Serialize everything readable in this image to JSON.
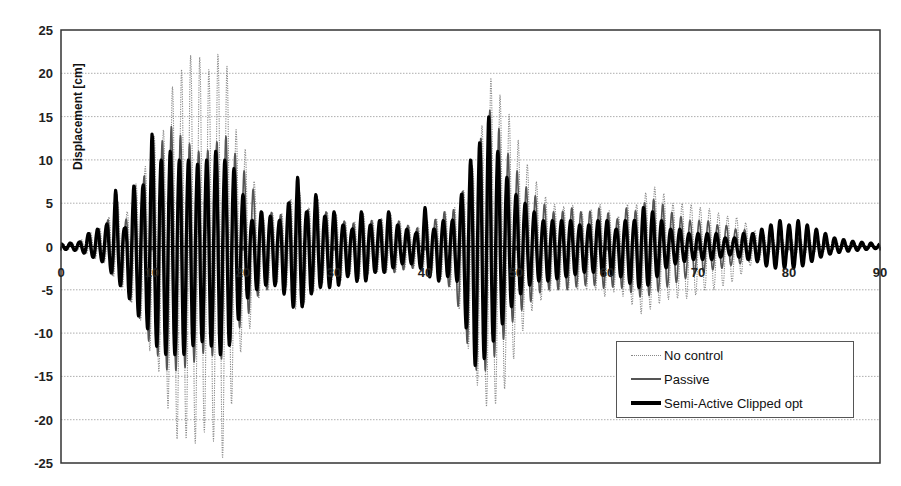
{
  "chart_data": {
    "type": "line",
    "title": "",
    "xlabel": "",
    "ylabel": "Displacement [cm]",
    "xlim": [
      0,
      90
    ],
    "ylim": [
      -25,
      25
    ],
    "x_ticks": [
      0,
      10,
      20,
      30,
      40,
      50,
      60,
      70,
      80,
      90
    ],
    "x_tick_labels": [
      "0",
      "10",
      "20",
      "30",
      "40",
      "50",
      "60",
      "70",
      "80",
      "90"
    ],
    "y_ticks": [
      25,
      20,
      15,
      10,
      5,
      0,
      -5,
      -10,
      -15,
      -20,
      -25
    ],
    "y_tick_labels": [
      "25",
      "20",
      "15",
      "10",
      "5",
      "0",
      "-5",
      "-10",
      "-15",
      "-20",
      "-25"
    ],
    "grid": {
      "horizontal": true,
      "vertical": false,
      "style": "dotted"
    },
    "legend_position": "lower right (inside plot)",
    "series": [
      {
        "name": "No control",
        "style": "dotted-thin",
        "color": "#8a8a8a",
        "peaks_t": [
          0,
          2,
          3,
          4,
          5,
          6,
          7,
          8,
          9,
          10,
          11,
          12,
          13,
          14,
          15,
          16,
          17,
          18,
          19,
          20,
          21,
          22,
          23,
          24,
          25,
          26,
          27,
          28,
          29,
          30,
          31,
          32,
          33,
          34,
          35,
          36,
          37,
          38,
          39,
          40,
          41,
          42,
          43,
          44,
          45,
          46,
          47,
          48,
          49,
          50,
          51,
          52,
          53,
          54,
          55,
          56,
          57,
          58,
          59,
          60,
          61,
          62,
          63,
          64,
          65,
          66,
          67,
          68,
          69,
          70,
          71,
          72,
          73,
          74,
          75,
          76,
          77,
          78,
          79,
          80,
          81,
          82,
          83,
          84,
          85,
          86,
          87,
          88,
          89,
          90
        ],
        "peaks_max": [
          0.3,
          0.5,
          1.5,
          2,
          2.5,
          6,
          3,
          7,
          8,
          13,
          12,
          18,
          20,
          22,
          22.5,
          20,
          22,
          23,
          14,
          12,
          9,
          3,
          4,
          3.5,
          5,
          7,
          4,
          6,
          4,
          4,
          3,
          2.5,
          4,
          3,
          3,
          4,
          3,
          2.5,
          2,
          3,
          3,
          4,
          4,
          6,
          8,
          12,
          20,
          18,
          16,
          13,
          10,
          8,
          6,
          5,
          4.5,
          5,
          4,
          4,
          5,
          4.5,
          3,
          5,
          4.5,
          6,
          7,
          6.5,
          5,
          5,
          5,
          4.5,
          4.5,
          4,
          3.5,
          3.5,
          3,
          2,
          1.5,
          1,
          1,
          1,
          1,
          1,
          0.8,
          0.6,
          0.5,
          0.4,
          0.3,
          0.3,
          0.2,
          0.2
        ],
        "peaks_min": [
          -0.3,
          -0.5,
          -1,
          -1.5,
          -2,
          -4,
          -5,
          -7,
          -9,
          -13,
          -15,
          -20,
          -23,
          -22,
          -23,
          -21,
          -23,
          -25,
          -16,
          -11,
          -9,
          -5,
          -5,
          -4,
          -5,
          -8,
          -6,
          -5,
          -4,
          -4,
          -4,
          -3,
          -4,
          -3,
          -3,
          -3,
          -3,
          -2.5,
          -2.5,
          -3,
          -3,
          -4,
          -5,
          -8,
          -13,
          -17,
          -19,
          -18,
          -16,
          -12,
          -9,
          -7,
          -6,
          -5,
          -5,
          -5,
          -5,
          -5,
          -5,
          -6,
          -5,
          -6,
          -7,
          -8,
          -7,
          -6.5,
          -6,
          -6,
          -6,
          -5.5,
          -5,
          -5,
          -4.5,
          -4,
          -3,
          -2,
          -1.5,
          -1,
          -1,
          -1,
          -1,
          -1,
          -0.8,
          -0.6,
          -0.5,
          -0.4,
          -0.3,
          -0.3,
          -0.2,
          -0.2
        ]
      },
      {
        "name": "Passive",
        "style": "solid-medium",
        "color": "#555555",
        "peaks_t": [
          0,
          2,
          3,
          4,
          5,
          6,
          7,
          8,
          9,
          10,
          11,
          12,
          13,
          14,
          15,
          16,
          17,
          18,
          19,
          20,
          21,
          22,
          23,
          24,
          25,
          26,
          27,
          28,
          29,
          30,
          31,
          32,
          33,
          34,
          35,
          36,
          37,
          38,
          39,
          40,
          41,
          42,
          43,
          44,
          45,
          46,
          47,
          48,
          49,
          50,
          51,
          52,
          53,
          54,
          55,
          56,
          57,
          58,
          59,
          60,
          61,
          62,
          63,
          64,
          65,
          66,
          67,
          68,
          69,
          70,
          71,
          72,
          73,
          74,
          75,
          76,
          77,
          78,
          79,
          80,
          81,
          82,
          83,
          84,
          85,
          86,
          87,
          88,
          89,
          90
        ],
        "peaks_max": [
          0.3,
          0.5,
          1.5,
          2,
          2.5,
          6.5,
          2.5,
          7,
          7.5,
          12.5,
          12,
          14,
          13,
          12,
          11,
          11,
          12,
          13,
          11,
          9,
          7,
          4,
          4,
          3.5,
          5,
          7,
          4,
          6,
          4,
          4,
          3,
          2.5,
          4,
          3,
          3,
          4,
          3,
          2.5,
          2,
          3,
          3,
          4,
          4,
          6,
          9,
          12,
          16,
          14,
          11,
          9,
          7,
          6,
          5,
          4,
          4,
          4.5,
          4,
          4,
          4.5,
          4,
          3,
          4.5,
          4,
          5,
          5.5,
          5,
          4,
          3.5,
          3,
          3,
          3,
          2.5,
          2.5,
          2,
          2,
          1.5,
          1.5,
          1,
          1,
          1,
          1,
          1,
          0.8,
          0.6,
          0.5,
          0.4,
          0.3,
          0.3,
          0.2,
          0.2
        ],
        "peaks_min": [
          -0.3,
          -0.5,
          -1,
          -1.5,
          -2,
          -4,
          -5,
          -7,
          -9,
          -12,
          -13,
          -15,
          -14,
          -14,
          -13,
          -12,
          -13,
          -13,
          -10,
          -9,
          -7,
          -5,
          -5,
          -4,
          -5,
          -8,
          -6,
          -5,
          -4,
          -4,
          -4,
          -3,
          -4,
          -3,
          -3,
          -3,
          -3,
          -2.5,
          -2.5,
          -3,
          -3,
          -4,
          -5,
          -8,
          -13,
          -15,
          -14,
          -12,
          -10,
          -8,
          -7,
          -6,
          -5,
          -5,
          -5,
          -5,
          -4.5,
          -4.5,
          -4.5,
          -5,
          -4.5,
          -5,
          -5.5,
          -6,
          -5.5,
          -5,
          -4.5,
          -4,
          -3.5,
          -3,
          -3,
          -2.5,
          -2.5,
          -2,
          -2,
          -1.5,
          -1.5,
          -1,
          -1,
          -1,
          -1,
          -1,
          -0.8,
          -0.6,
          -0.5,
          -0.4,
          -0.3,
          -0.3,
          -0.2,
          -0.2
        ]
      },
      {
        "name": "Semi-Active Clipped opt",
        "style": "solid-thick",
        "color": "#000000",
        "peaks_t": [
          0,
          2,
          3,
          4,
          5,
          6,
          7,
          8,
          9,
          10,
          11,
          12,
          13,
          14,
          15,
          16,
          17,
          18,
          19,
          20,
          21,
          22,
          23,
          24,
          25,
          26,
          27,
          28,
          29,
          30,
          31,
          32,
          33,
          34,
          35,
          36,
          37,
          38,
          39,
          40,
          41,
          42,
          43,
          44,
          45,
          46,
          47,
          48,
          49,
          50,
          51,
          52,
          53,
          54,
          55,
          56,
          57,
          58,
          59,
          60,
          61,
          62,
          63,
          64,
          65,
          66,
          67,
          68,
          69,
          70,
          71,
          72,
          73,
          74,
          75,
          76,
          77,
          78,
          79,
          80,
          81,
          82,
          83,
          84,
          85,
          86,
          87,
          88,
          89,
          90
        ],
        "peaks_max": [
          0.3,
          0.5,
          1.5,
          2,
          2.5,
          6.5,
          2,
          7,
          7,
          13,
          10,
          11,
          10,
          10,
          9.5,
          10,
          11,
          10,
          9,
          6,
          3,
          4,
          3.5,
          3,
          5,
          8,
          4,
          6,
          3.5,
          4,
          2.5,
          2,
          4,
          2.5,
          3,
          4,
          2.5,
          2,
          1.5,
          4.5,
          2,
          3,
          3,
          6,
          10,
          12,
          15,
          11,
          8,
          6,
          5,
          4,
          3,
          3,
          3,
          3,
          2.5,
          2.5,
          3,
          3,
          2,
          3,
          3,
          4.5,
          4,
          3,
          2,
          2,
          1.5,
          1.5,
          1.5,
          1.5,
          1,
          1,
          1.5,
          1.5,
          2,
          2.5,
          3,
          2.5,
          3,
          2.5,
          2,
          1.5,
          1,
          0.8,
          0.6,
          0.5,
          0.4,
          0.3,
          0.2
        ],
        "peaks_min": [
          -0.3,
          -0.5,
          -1,
          -1.5,
          -2,
          -4,
          -5,
          -7,
          -9,
          -10,
          -13,
          -12,
          -13,
          -12,
          -11,
          -11,
          -12,
          -13,
          -10,
          -7,
          -5,
          -5,
          -4,
          -5,
          -6,
          -8,
          -6,
          -5,
          -4.5,
          -5,
          -4,
          -3,
          -5,
          -3,
          -3,
          -3,
          -2,
          -2,
          -2,
          -3,
          -4,
          -4,
          -3,
          -5,
          -13.5,
          -14,
          -12,
          -10,
          -8,
          -6,
          -5,
          -4,
          -4,
          -4,
          -3.5,
          -3.5,
          -3,
          -3,
          -3,
          -3.5,
          -3,
          -4,
          -4.5,
          -5,
          -4,
          -3,
          -2,
          -2,
          -1.5,
          -1.5,
          -1.5,
          -1.5,
          -1,
          -1,
          -1.5,
          -1.5,
          -2,
          -2.5,
          -2.5,
          -2.5,
          -2.5,
          -2,
          -1.5,
          -1,
          -0.8,
          -0.6,
          -0.5,
          -0.4,
          -0.3,
          -0.2
        ]
      }
    ]
  },
  "legend": {
    "items": [
      {
        "label": "No control"
      },
      {
        "label": "Passive"
      },
      {
        "label": "Semi-Active Clipped opt"
      }
    ]
  }
}
